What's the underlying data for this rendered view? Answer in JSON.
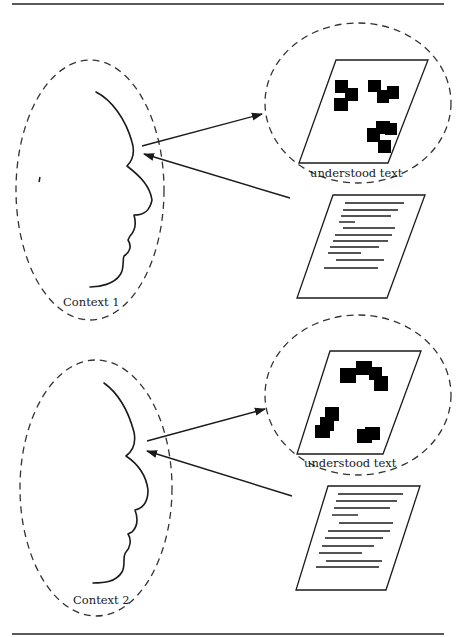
{
  "figure": {
    "panels": [
      {
        "id": "context1",
        "context_label": "Context 1",
        "understood_label": "understood text"
      },
      {
        "id": "context2",
        "context_label": "Context 2",
        "understood_label": "understood text"
      }
    ],
    "colors": {
      "ink": "#1a1a1a",
      "background": "#ffffff"
    }
  }
}
